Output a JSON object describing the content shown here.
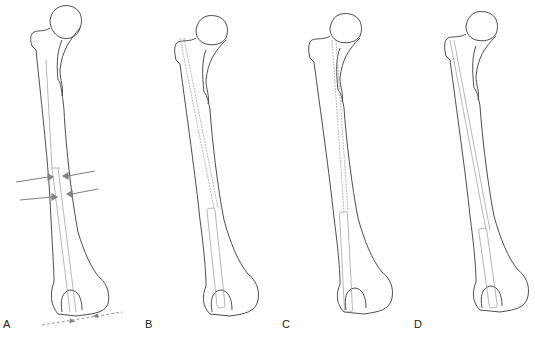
{
  "figure": {
    "colors": {
      "bone_outline": "#3a3a3a",
      "inner_line": "#9a9a9a",
      "arrow": "#808080"
    },
    "panels": [
      {
        "label": "A",
        "offset_x": 0,
        "rod": "short-with-arrows"
      },
      {
        "label": "B",
        "offset_x": 140,
        "rod": "full-length-guide"
      },
      {
        "label": "C",
        "offset_x": 278,
        "rod": "full-length-guide"
      },
      {
        "label": "D",
        "offset_x": 408,
        "rod": "full-length-guide"
      }
    ]
  }
}
